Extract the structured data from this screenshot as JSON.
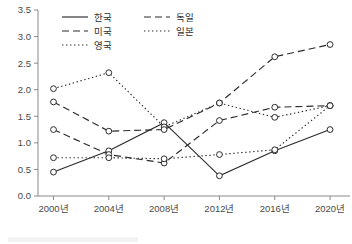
{
  "chart_data": {
    "type": "line",
    "title": "",
    "xlabel": "",
    "ylabel": "",
    "categories": [
      "2000년",
      "2004년",
      "2008년",
      "2012년",
      "2016년",
      "2020년"
    ],
    "x_tick_labels": [
      "2000년",
      "2004년",
      "2008년",
      "2012년",
      "2016년",
      "2020년"
    ],
    "y_tick_labels": [
      "0.0",
      "0.5",
      "1.0",
      "1.5",
      "2.0",
      "2.5",
      "3.0",
      "3.5"
    ],
    "y_ticks": [
      0.0,
      0.5,
      1.0,
      1.5,
      2.0,
      2.5,
      3.0,
      3.5
    ],
    "ylim": [
      0.0,
      3.5
    ],
    "grid": false,
    "legend_position": "top-center",
    "marker": "open-circle",
    "series": [
      {
        "name": "한국",
        "style": "solid",
        "values": [
          0.45,
          0.85,
          1.38,
          0.38,
          0.85,
          1.25
        ]
      },
      {
        "name": "미국",
        "style": "dashed",
        "values": [
          1.25,
          0.78,
          0.62,
          1.42,
          1.67,
          1.7
        ]
      },
      {
        "name": "영국",
        "style": "dotted",
        "values": [
          2.02,
          2.32,
          1.3,
          1.75,
          1.48,
          1.7
        ]
      },
      {
        "name": "독일",
        "style": "dashed",
        "values": [
          1.77,
          1.22,
          1.25,
          1.75,
          2.62,
          2.85
        ]
      },
      {
        "name": "일본",
        "style": "dotted",
        "values": [
          0.72,
          0.72,
          0.7,
          0.78,
          0.87,
          1.7
        ]
      }
    ]
  },
  "legend": {
    "entries": [
      {
        "label": "한국",
        "style": "solid"
      },
      {
        "label": "독일",
        "style": "dashed"
      },
      {
        "label": "미국",
        "style": "dashed"
      },
      {
        "label": "일본",
        "style": "dotted"
      },
      {
        "label": "영국",
        "style": "dotted"
      }
    ]
  }
}
